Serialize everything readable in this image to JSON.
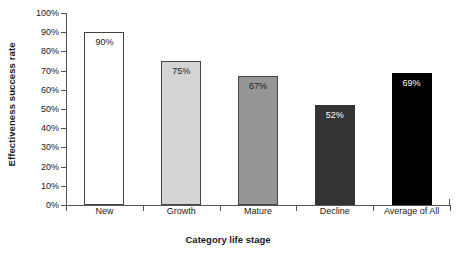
{
  "chart_data": {
    "type": "bar",
    "title": "",
    "xlabel": "Category life stage",
    "ylabel": "Effectiveness success rate",
    "categories": [
      "New",
      "Growth",
      "Mature",
      "Decline",
      "Average of All"
    ],
    "values": [
      90,
      75,
      67,
      52,
      69
    ],
    "value_labels": [
      "90%",
      "75%",
      "67%",
      "52%",
      "69%"
    ],
    "ylim": [
      0,
      100
    ],
    "ytick_labels": [
      "0%",
      "10%",
      "20%",
      "30%",
      "40%",
      "50%",
      "60%",
      "70%",
      "80%",
      "90%",
      "100%"
    ],
    "ytick_values": [
      0,
      10,
      20,
      30,
      40,
      50,
      60,
      70,
      80,
      90,
      100
    ],
    "grid": false,
    "legend": "none",
    "bar_colors": [
      "#ffffff",
      "#d4d4d4",
      "#969696",
      "#333333",
      "#000000"
    ],
    "bar_edge_colors": [
      "#444444",
      "#444444",
      "#444444",
      "#333333",
      "#000000"
    ],
    "bar_label_colors": [
      "#1a1a1a",
      "#1a1a1a",
      "#1a1a1a",
      "#ffffff",
      "#ffffff"
    ],
    "axis_color": "#555555"
  }
}
